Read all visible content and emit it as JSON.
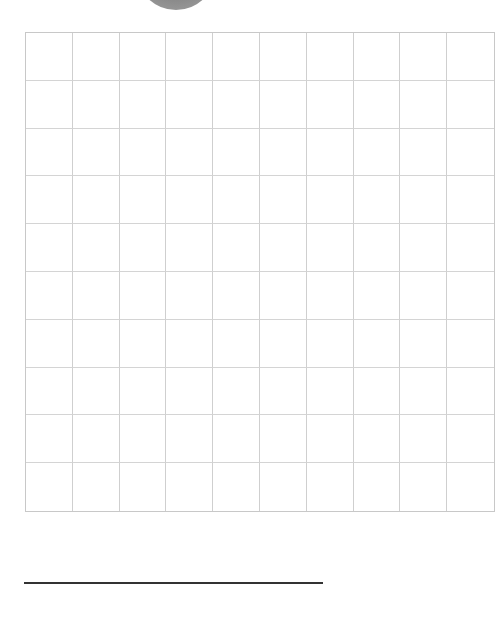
{
  "worksheet": {
    "top_shape": {
      "type": "circle",
      "color": "#8f8f8f",
      "partially_visible": true
    },
    "grid": {
      "rows": 10,
      "columns": 10,
      "line_color": "#cfcfcf"
    },
    "answer_line": {
      "color": "#333333"
    }
  }
}
